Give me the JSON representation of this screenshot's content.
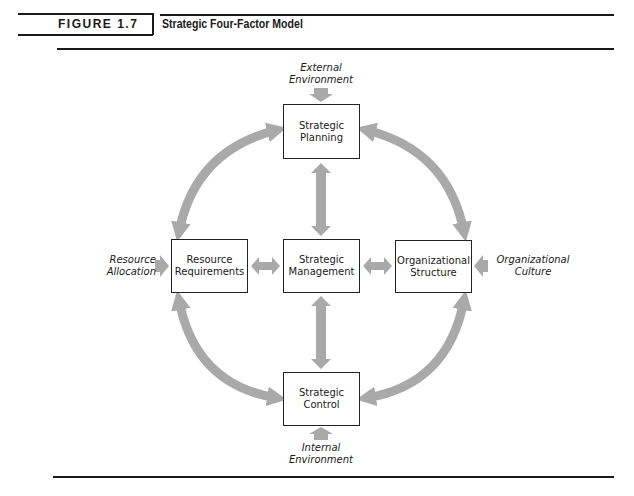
{
  "figure": {
    "label": "FIGURE 1.7",
    "title": "Strategic Four-Factor Model"
  },
  "nodes": {
    "planning": {
      "line1": "Strategic",
      "line2": "Planning"
    },
    "resource": {
      "line1": "Resource",
      "line2": "Requirements"
    },
    "management": {
      "line1": "Strategic",
      "line2": "Management"
    },
    "structure": {
      "line1": "Organizational",
      "line2": "Structure"
    },
    "control": {
      "line1": "Strategic",
      "line2": "Control"
    }
  },
  "external_inputs": {
    "top": {
      "line1": "External",
      "line2": "Environment"
    },
    "left": {
      "line1": "Resource",
      "line2": "Allocation"
    },
    "right": {
      "line1": "Organizational",
      "line2": "Culture"
    },
    "bottom": {
      "line1": "Internal",
      "line2": "Environment"
    }
  },
  "colors": {
    "arrow_fill": "#a9a9a9",
    "box_border": "#222222",
    "rule": "#1a1a1a"
  }
}
